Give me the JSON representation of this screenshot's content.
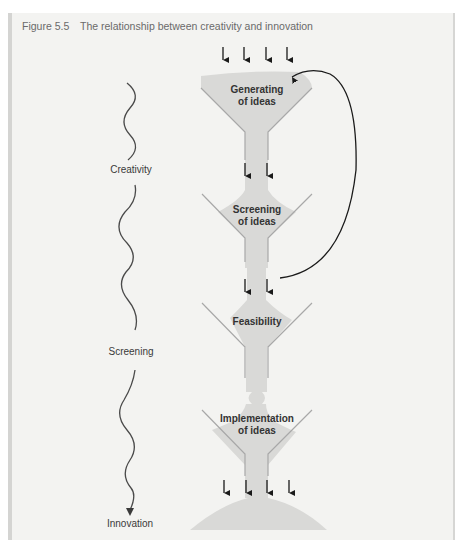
{
  "figure": {
    "number": "Figure 5.5",
    "title": "The relationship between creativity and innovation"
  },
  "funnels": [
    {
      "label_line1": "Generating",
      "label_line2": "of ideas"
    },
    {
      "label_line1": "Screening",
      "label_line2": "of ideas"
    },
    {
      "label_line1": "Feasibility",
      "label_line2": ""
    },
    {
      "label_line1": "Implementation",
      "label_line2": "of ideas"
    }
  ],
  "stages": [
    {
      "label": "Creativity"
    },
    {
      "label": "Screening"
    },
    {
      "label": "Innovation"
    }
  ],
  "colors": {
    "panel_bg": "#f3f3f1",
    "funnel_fill": "#d9d9d7",
    "funnel_line": "#a8a8a8",
    "arrow": "#1a1a1a"
  }
}
